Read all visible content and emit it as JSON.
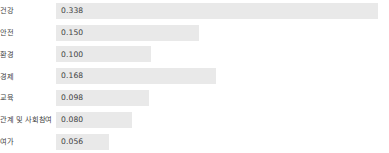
{
  "chart_data": {
    "type": "bar",
    "orientation": "horizontal",
    "title": "",
    "subtitle": "",
    "xlabel": "",
    "ylabel": "",
    "grid": false,
    "legend": null,
    "axis_visible": false,
    "xlim": [
      0,
      0.338
    ],
    "bar_color": "#e9e9e9",
    "background_color": "#ffffff",
    "text_color": "#3f3f3f",
    "categories": [
      "건강",
      "안전",
      "환경",
      "경제",
      "교육",
      "관계 및 사회참여",
      "여가"
    ],
    "values": [
      0.338,
      0.15,
      0.1,
      0.168,
      0.098,
      0.08,
      0.056
    ],
    "value_labels": [
      "0.338",
      "0.150",
      "0.100",
      "0.168",
      "0.098",
      "0.080",
      "0.056"
    ],
    "rows": [
      {
        "category": "건강",
        "value": 0.338,
        "value_label": "0.338",
        "bar_width_px": 322
      },
      {
        "category": "안전",
        "value": 0.15,
        "value_label": "0.150",
        "bar_width_px": 155
      },
      {
        "category": "환경",
        "value": 0.1,
        "value_label": "0.100",
        "bar_width_px": 93
      },
      {
        "category": "경제",
        "value": 0.168,
        "value_label": "0.168",
        "bar_width_px": 166
      },
      {
        "category": "교육",
        "value": 0.098,
        "value_label": "0.098",
        "bar_width_px": 91
      },
      {
        "category": "관계 및 사회참여",
        "value": 0.08,
        "value_label": "0.080",
        "bar_width_px": 72
      },
      {
        "category": "여가",
        "value": 0.056,
        "value_label": "0.056",
        "bar_width_px": 49
      }
    ]
  }
}
